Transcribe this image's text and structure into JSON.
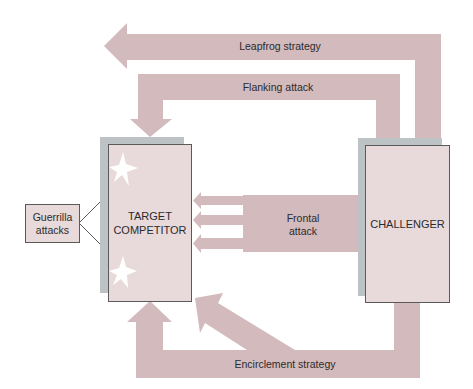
{
  "diagram": {
    "nodes": {
      "target": {
        "line1": "TARGET",
        "line2": "COMPETITOR"
      },
      "challenger": {
        "label": "CHALLENGER"
      },
      "guerrilla": {
        "line1": "Guerrilla",
        "line2": "attacks"
      }
    },
    "arrows": {
      "leapfrog": "Leapfrog strategy",
      "flanking": "Flanking attack",
      "frontal_line1": "Frontal",
      "frontal_line2": "attack",
      "encirclement": "Encirclement strategy"
    },
    "colors": {
      "arrow": "#d3babd",
      "box_fill": "#e8d9db",
      "shadow": "#bdc3c4",
      "border": "#5a5a5a"
    }
  }
}
